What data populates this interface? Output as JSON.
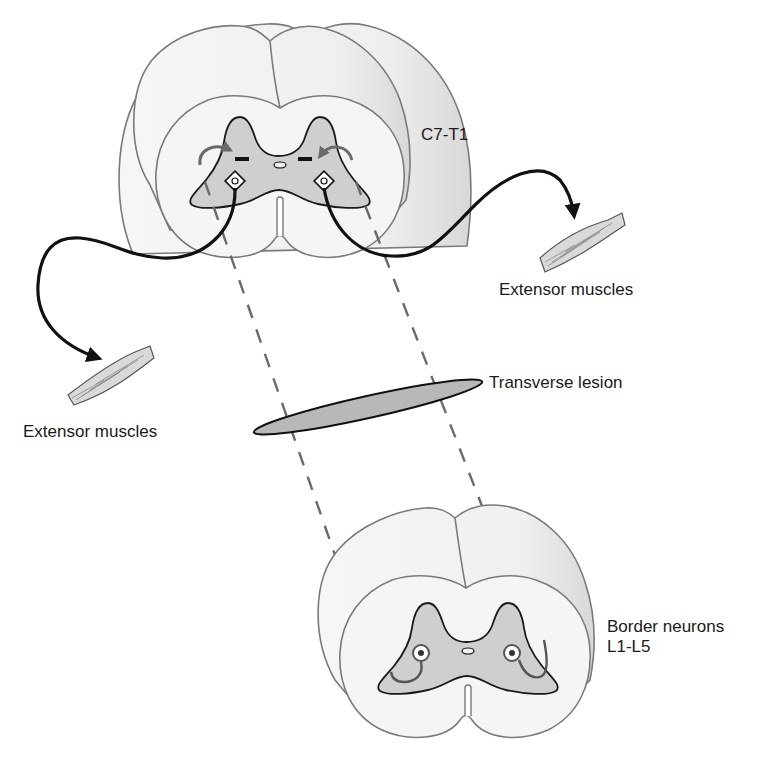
{
  "figure": {
    "colors": {
      "background": "#ffffff",
      "white_matter_fill": "#f4f4f4",
      "white_matter_stroke": "#7a7a7a",
      "gray_matter_fill": "#cfcfcf",
      "gray_matter_stroke": "#1a1a1a",
      "lesion_fill": "#b8b8b8",
      "dashed_line": "#6a6a6a",
      "axon": "#111111",
      "muscle_fill": "#d9d9d9"
    }
  },
  "labels": {
    "upper_segment": "C7-T1",
    "right_muscle": "Extensor muscles",
    "left_muscle": "Extensor muscles",
    "lesion": "Transverse lesion",
    "border_neurons_line1": "Border neurons",
    "border_neurons_line2": "L1-L5"
  },
  "elements": {
    "upper_cord": {
      "segment": "C7-T1",
      "neurons": [
        "left-motor-neuron",
        "right-motor-neuron"
      ]
    },
    "lower_cord": {
      "segment": "L1-L5",
      "neurons": [
        "left-border-neuron",
        "right-border-neuron"
      ]
    },
    "lesion": {
      "type": "transverse"
    },
    "projections": [
      "left-ascending-projection",
      "right-ascending-projection"
    ],
    "axons": [
      "left-motor-axon",
      "right-motor-axon"
    ],
    "muscles": [
      "left-extensor-muscle",
      "right-extensor-muscle"
    ]
  }
}
